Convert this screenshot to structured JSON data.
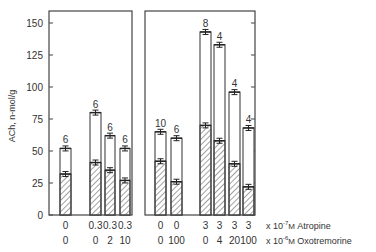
{
  "chart_data": {
    "type": "bar",
    "title": "",
    "xlabel": "",
    "ylabel": "ACh, n-mol/g",
    "ylim": [
      0,
      160
    ],
    "yticks": [
      0,
      25,
      50,
      75,
      100,
      125,
      150
    ],
    "grid": false,
    "stacked_overlay": true,
    "legend": "none",
    "x_row_labels": [
      {
        "unit_prefix": "x 10",
        "exponent": "-7",
        "unit": "M",
        "drug": "Atropine"
      },
      {
        "unit_prefix": "x 10",
        "exponent": "-6",
        "unit": "M",
        "drug": "Oxotremorine"
      }
    ],
    "panels": [
      {
        "name": "left",
        "bars": [
          {
            "atropine": "0",
            "oxotremorine": "0",
            "total": 52,
            "hatched": 32,
            "n": "6"
          },
          {
            "atropine": "0.3",
            "oxotremorine": "0",
            "total": 80,
            "hatched": 41,
            "n": "6"
          },
          {
            "atropine": "0.3",
            "oxotremorine": "2",
            "total": 62,
            "hatched": 35,
            "n": "6"
          },
          {
            "atropine": "0.3",
            "oxotremorine": "10",
            "total": 52,
            "hatched": 27,
            "n": "6"
          }
        ]
      },
      {
        "name": "right",
        "bars": [
          {
            "atropine": "0",
            "oxotremorine": "0",
            "total": 65,
            "hatched": 42,
            "n": "10"
          },
          {
            "atropine": "0",
            "oxotremorine": "100",
            "total": 60,
            "hatched": 26,
            "n": "6"
          },
          {
            "atropine": "3",
            "oxotremorine": "0",
            "total": 143,
            "hatched": 70,
            "n": "8"
          },
          {
            "atropine": "3",
            "oxotremorine": "4",
            "total": 133,
            "hatched": 58,
            "n": "4"
          },
          {
            "atropine": "3",
            "oxotremorine": "20",
            "total": 96,
            "hatched": 40,
            "n": "4"
          },
          {
            "atropine": "3",
            "oxotremorine": "100",
            "total": 68,
            "hatched": 22,
            "n": "4"
          }
        ]
      }
    ],
    "series": [
      {
        "name": "Total ACh (open bar)",
        "values": [
          52,
          80,
          62,
          52,
          65,
          60,
          143,
          133,
          96,
          68
        ]
      },
      {
        "name": "Hatched portion",
        "values": [
          32,
          41,
          35,
          27,
          42,
          26,
          70,
          58,
          40,
          22
        ]
      }
    ],
    "categories": [
      "0/0",
      "0.3/0",
      "0.3/2",
      "0.3/10",
      "0/0",
      "0/100",
      "3/0",
      "3/4",
      "3/20",
      "3/100"
    ]
  },
  "axis": {
    "ylabel": "ACh, n-mol/g",
    "tick_labels": [
      "0",
      "25",
      "50",
      "75",
      "100",
      "125",
      "150"
    ]
  },
  "row_labels": {
    "atropine": {
      "prefix": "x 10",
      "exp": "-7",
      "unit": "M",
      "name": "Atropine"
    },
    "oxotremorine": {
      "prefix": "x 10",
      "exp": "-6",
      "unit": "M",
      "name": "Oxotremorine"
    }
  }
}
